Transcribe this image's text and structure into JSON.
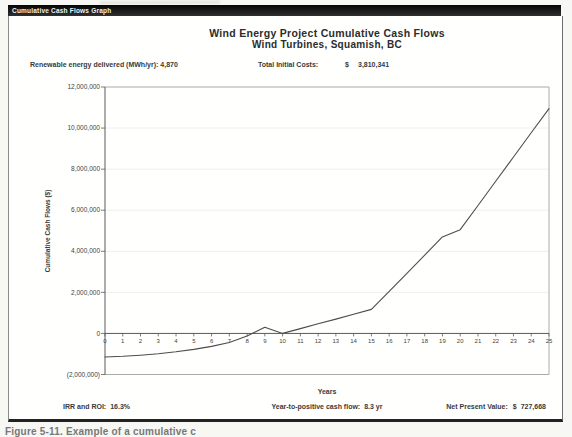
{
  "page": {
    "tab_label": "Cumulative Cash Flows Graph",
    "caption": "Figure 5-11. Example of a cumulative c"
  },
  "info": {
    "left_label": "Renewable energy delivered (MWh/yr):",
    "left_value": "4,870",
    "right_label": "Total Initial Costs:",
    "right_currency": "$",
    "right_value": "3,810,341"
  },
  "footer": {
    "irr_label": "IRR and ROI:",
    "irr_value": "16.3%",
    "payback_label": "Year-to-positive cash flow:",
    "payback_value": "8.3 yr",
    "npv_label": "Net Present Value:",
    "npv_currency": "$",
    "npv_value": "727,668"
  },
  "chart_data": {
    "type": "line",
    "title": "Wind Energy Project Cumulative Cash Flows",
    "subtitle": "Wind Turbines, Squamish, BC",
    "xlabel": "Years",
    "ylabel": "Cumulative Cash Flows ($)",
    "x": [
      0,
      1,
      2,
      3,
      4,
      5,
      6,
      7,
      8,
      9,
      10,
      11,
      12,
      13,
      14,
      15,
      16,
      17,
      18,
      19,
      20,
      21,
      22,
      23,
      24,
      25
    ],
    "values": [
      -1150000,
      -1115000,
      -1060000,
      -985000,
      -895000,
      -780000,
      -630000,
      -440000,
      -120000,
      300000,
      0,
      235000,
      470000,
      700000,
      935000,
      1170000,
      2050000,
      2930000,
      3810000,
      4700000,
      5050000,
      6230000,
      7410000,
      8590000,
      9770000,
      10950000
    ],
    "xlim": [
      0,
      25
    ],
    "ylim": [
      -2000000,
      12000000
    ],
    "ytick_values": [
      12000000,
      10000000,
      8000000,
      6000000,
      4000000,
      2000000,
      0,
      -2000000
    ],
    "ytick_labels": [
      "12,000,000",
      "10,000,000",
      "8,000,000",
      "6,000,000",
      "4,000,000",
      "2,000,000",
      "0",
      "(2,000,000)"
    ],
    "grid": true,
    "legend": "none",
    "line_color": "#4d4d4d",
    "axis_color": "#5a5a5a",
    "border_color": "#ababab",
    "grid_color": "#e7e7e7",
    "annotations": {
      "year_to_positive": 8.3
    }
  }
}
